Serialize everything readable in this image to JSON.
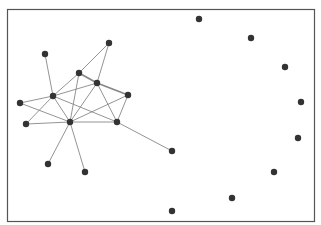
{
  "diagram": {
    "type": "network-graph",
    "frame": {
      "x": 7,
      "y": 9,
      "width": 307,
      "height": 212,
      "stroke": "#555555",
      "fill": "#ffffff"
    },
    "node_color": "#333333",
    "edge_color": "#888888",
    "node_radius": 3.2,
    "nodes": [
      {
        "id": "A",
        "x": 109,
        "y": 43
      },
      {
        "id": "B",
        "x": 79,
        "y": 73
      },
      {
        "id": "C",
        "x": 97,
        "y": 83
      },
      {
        "id": "D",
        "x": 45,
        "y": 54
      },
      {
        "id": "E",
        "x": 53,
        "y": 96
      },
      {
        "id": "F",
        "x": 128,
        "y": 95
      },
      {
        "id": "G",
        "x": 20,
        "y": 103
      },
      {
        "id": "H",
        "x": 70,
        "y": 122
      },
      {
        "id": "I",
        "x": 26,
        "y": 124
      },
      {
        "id": "J",
        "x": 117,
        "y": 122
      },
      {
        "id": "K",
        "x": 172,
        "y": 151
      },
      {
        "id": "L",
        "x": 48,
        "y": 164
      },
      {
        "id": "M",
        "x": 85,
        "y": 172
      },
      {
        "id": "N",
        "x": 199,
        "y": 19
      },
      {
        "id": "O",
        "x": 251,
        "y": 38
      },
      {
        "id": "P",
        "x": 285,
        "y": 67
      },
      {
        "id": "Q",
        "x": 301,
        "y": 102
      },
      {
        "id": "R",
        "x": 298,
        "y": 138
      },
      {
        "id": "S",
        "x": 274,
        "y": 172
      },
      {
        "id": "T",
        "x": 232,
        "y": 198
      },
      {
        "id": "U",
        "x": 172,
        "y": 211
      }
    ],
    "edges": [
      {
        "from": "A",
        "to": "B"
      },
      {
        "from": "A",
        "to": "C"
      },
      {
        "from": "D",
        "to": "E"
      },
      {
        "from": "B",
        "to": "C",
        "weight": 2
      },
      {
        "from": "C",
        "to": "F",
        "weight": 2
      },
      {
        "from": "B",
        "to": "E"
      },
      {
        "from": "C",
        "to": "E"
      },
      {
        "from": "B",
        "to": "H"
      },
      {
        "from": "C",
        "to": "H"
      },
      {
        "from": "C",
        "to": "J"
      },
      {
        "from": "F",
        "to": "J"
      },
      {
        "from": "F",
        "to": "H"
      },
      {
        "from": "G",
        "to": "E"
      },
      {
        "from": "G",
        "to": "H"
      },
      {
        "from": "I",
        "to": "E"
      },
      {
        "from": "I",
        "to": "H"
      },
      {
        "from": "E",
        "to": "H"
      },
      {
        "from": "E",
        "to": "J"
      },
      {
        "from": "H",
        "to": "J"
      },
      {
        "from": "J",
        "to": "K"
      },
      {
        "from": "H",
        "to": "L"
      },
      {
        "from": "H",
        "to": "M"
      }
    ]
  }
}
